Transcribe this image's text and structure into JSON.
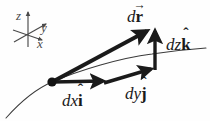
{
  "figure": {
    "background_color": "#fefefe",
    "ink_color": "#1a1a1a",
    "axis_color": "#4a4a4a",
    "width": 210,
    "height": 121
  },
  "axes_triad": {
    "name": "coordinate-axes",
    "center": {
      "x": 28,
      "y": 35
    },
    "labels": {
      "z": "z",
      "y": "y",
      "x": "x"
    }
  },
  "labels": {
    "dr": {
      "differential": "d",
      "symbol": "r",
      "accent": "→",
      "full": "dr⃗"
    },
    "dz": {
      "differential": "dz",
      "symbol": "k",
      "accent": "ˆ",
      "full": "dzk̂"
    },
    "dy": {
      "differential": "dy",
      "symbol": "j",
      "accent": "ˆ",
      "full": "dyĵ"
    },
    "dx": {
      "differential": "dx",
      "symbol": "i",
      "accent": "ˆ",
      "full": "dxî"
    }
  },
  "geometry": {
    "origin_point": {
      "x": 52,
      "y": 82,
      "radius": 4.5
    },
    "vectors": [
      {
        "name": "dr",
        "from": {
          "x": 52,
          "y": 82
        },
        "to": {
          "x": 150,
          "y": 29
        },
        "stroke": 4.0
      },
      {
        "name": "dx",
        "from": {
          "x": 52,
          "y": 82
        },
        "to": {
          "x": 107,
          "y": 81
        },
        "stroke": 3.4
      },
      {
        "name": "dy",
        "from": {
          "x": 104,
          "y": 83
        },
        "to": {
          "x": 155,
          "y": 68
        },
        "stroke": 3.4
      },
      {
        "name": "dz",
        "from": {
          "x": 155,
          "y": 70
        },
        "to": {
          "x": 155,
          "y": 28
        },
        "stroke": 3.4
      }
    ],
    "curve": {
      "name": "path-curve",
      "stroke": 1.0,
      "path": "M 6 118 C 22 100 38 88 52 82 C 80 70 120 58 152 54 C 172 51 192 49 206 48"
    }
  }
}
